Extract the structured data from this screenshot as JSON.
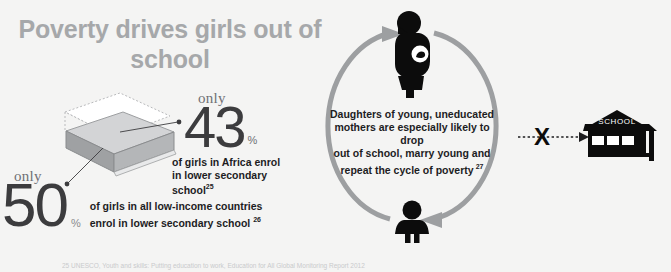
{
  "colors": {
    "background": "#f4f4f3",
    "title_gray": "#a6a8aa",
    "arc_gray": "#9d9fa1",
    "ink_black": "#1d1d1f",
    "num_gray": "#3c3c3e",
    "block_gray": "#a3a5a7",
    "footnote_gray": "#c9cacc"
  },
  "title": {
    "text": "Poverty drives girls out of school"
  },
  "stat_43": {
    "only_label": "only",
    "value": "43",
    "percent_symbol": "%",
    "description_line1": "of girls in Africa enrol",
    "description_line2": "in lower secondary",
    "description_line3": "school",
    "footnote_ref": "25"
  },
  "stat_50": {
    "only_label": "only",
    "value": "50",
    "percent_symbol": "%",
    "description_line1": "of girls in all low-income countries",
    "description_line2": "enrol in lower secondary school",
    "footnote_ref": "26"
  },
  "cycle": {
    "text_line1": "Daughters of young, uneducated",
    "text_line2": "mothers are especially likely to drop",
    "text_line3": "out of school, marry young and",
    "text_line4": "repeat the cycle of poverty",
    "footnote_ref": "27",
    "top_icon": "pregnant-woman-icon",
    "bottom_icon": "young-girl-icon"
  },
  "school": {
    "sign_label": "SCHOOL",
    "blocked_marker": "X"
  },
  "footnote": {
    "text": "25 UNESCO, Youth and skills: Putting education to work, Education for All Global Monitoring Report 2012"
  }
}
